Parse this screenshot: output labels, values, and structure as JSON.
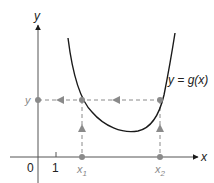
{
  "diagram": {
    "axes": {
      "x_label": "x",
      "y_label": "y",
      "origin_label": "0",
      "tick_label": "1"
    },
    "curve_label": "y = g(x)",
    "points": {
      "x1_label": "x",
      "x1_sub": "1",
      "x2_label": "x",
      "x2_sub": "2",
      "y_label": "y"
    },
    "colors": {
      "curve": "#1a1a1a",
      "axis": "#555555",
      "dashed": "#8a8a8a",
      "markers": "#8a8a8a"
    }
  }
}
